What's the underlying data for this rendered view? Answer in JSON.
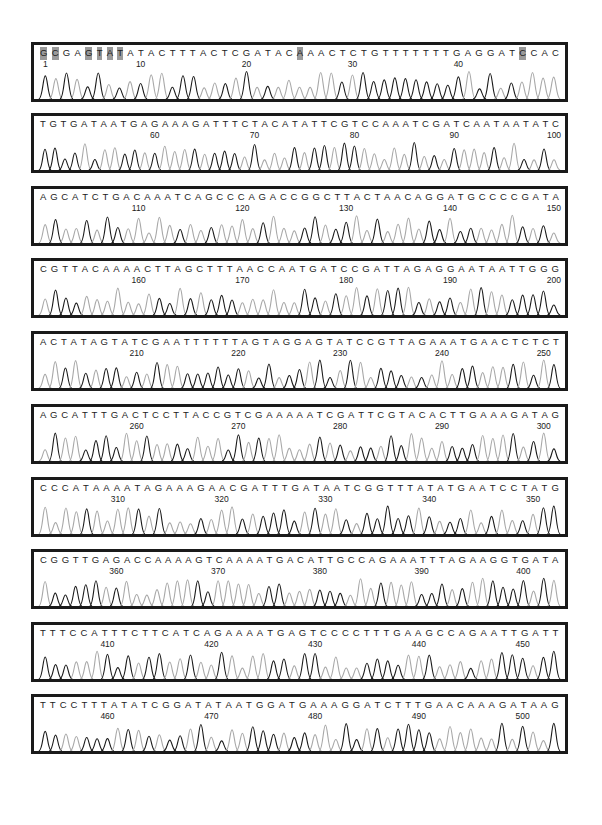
{
  "figure": {
    "type": "dna-sequencing-chromatogram",
    "rows": [
      {
        "sequence": "GCGAGTATATACTTTACTCGATACAAACTCTGTTTTTTTGAGGATCCAC",
        "start": 1,
        "labels": [
          "1",
          "10",
          "20",
          "30",
          "40"
        ],
        "label_positions": [
          1,
          10,
          20,
          30,
          40
        ],
        "highlighted_positions": [
          1,
          2,
          5,
          6,
          7,
          8,
          25,
          46
        ]
      },
      {
        "sequence": "TGTGATAATGAGAAAGATTTCTACATATTCGTCCAAATCGATCAATAATATC",
        "start": 49,
        "labels": [
          "60",
          "70",
          "80",
          "90",
          "100"
        ],
        "label_positions": [
          60,
          70,
          80,
          90,
          100
        ],
        "highlighted_positions": []
      },
      {
        "sequence": "AGCATCTGACAAATCAGCCCAGACCGGCTTACTAACAGGATGCCCCGATA",
        "start": 101,
        "labels": [
          "110",
          "120",
          "130",
          "140",
          "150"
        ],
        "label_positions": [
          110,
          120,
          130,
          140,
          150
        ],
        "highlighted_positions": []
      },
      {
        "sequence": "CGTTACAAAACTTAGCTTTAACCAATGATCCGATTAGAGGAATAATTGGG",
        "start": 151,
        "labels": [
          "160",
          "170",
          "180",
          "190",
          "200"
        ],
        "label_positions": [
          160,
          170,
          180,
          190,
          200
        ],
        "highlighted_positions": []
      },
      {
        "sequence": "ACTATAGTATCGAATTTTTTAGTAGGAGTATCCGTTAGAAATGAACTCTCT",
        "start": 201,
        "labels": [
          "210",
          "220",
          "230",
          "240",
          "250"
        ],
        "label_positions": [
          210,
          220,
          230,
          240,
          250
        ],
        "highlighted_positions": []
      },
      {
        "sequence": "AGCATTTGACTCCTTACCGTCGAAAAATCGATTCGTACACTTGAAAGATAG",
        "start": 251,
        "labels": [
          "260",
          "270",
          "280",
          "290",
          "300"
        ],
        "label_positions": [
          260,
          270,
          280,
          290,
          300
        ],
        "highlighted_positions": []
      },
      {
        "sequence": "CCCATAAAATAGAAAGAACGATTTGATAATCGGTTTATATGAATCCTATG",
        "start": 303,
        "labels": [
          "310",
          "320",
          "330",
          "340",
          "350"
        ],
        "label_positions": [
          310,
          320,
          330,
          340,
          350
        ],
        "highlighted_positions": []
      },
      {
        "sequence": "CGGTTGAGACCAAAAGTCAAAATGACATTGCCAGAAATTTAGAAGGTGATA",
        "start": 353,
        "labels": [
          "360",
          "370",
          "380",
          "390",
          "400"
        ],
        "label_positions": [
          360,
          370,
          380,
          390,
          400
        ],
        "highlighted_positions": []
      },
      {
        "sequence": "TTTCCATTTCTTCATCAGAAAATGAGTCCCCTTTGAAGCCAGAATTGATT",
        "start": 404,
        "labels": [
          "410",
          "420",
          "430",
          "440",
          "450"
        ],
        "label_positions": [
          410,
          420,
          430,
          440,
          450
        ],
        "highlighted_positions": []
      },
      {
        "sequence": "TTCCTTTATATCGGATATAATGGATGAAAGGATCTTTGAACAAAGATAAG",
        "start": 454,
        "labels": [
          "460",
          "470",
          "480",
          "490",
          "500"
        ],
        "label_positions": [
          460,
          470,
          480,
          490,
          500
        ],
        "highlighted_positions": []
      }
    ],
    "colors": {
      "border": "#1a1a1a",
      "trace_dark": "#1a1a1a",
      "trace_light": "#a8a8a8",
      "highlight": "#9a9a9a",
      "text": "#222222"
    }
  }
}
